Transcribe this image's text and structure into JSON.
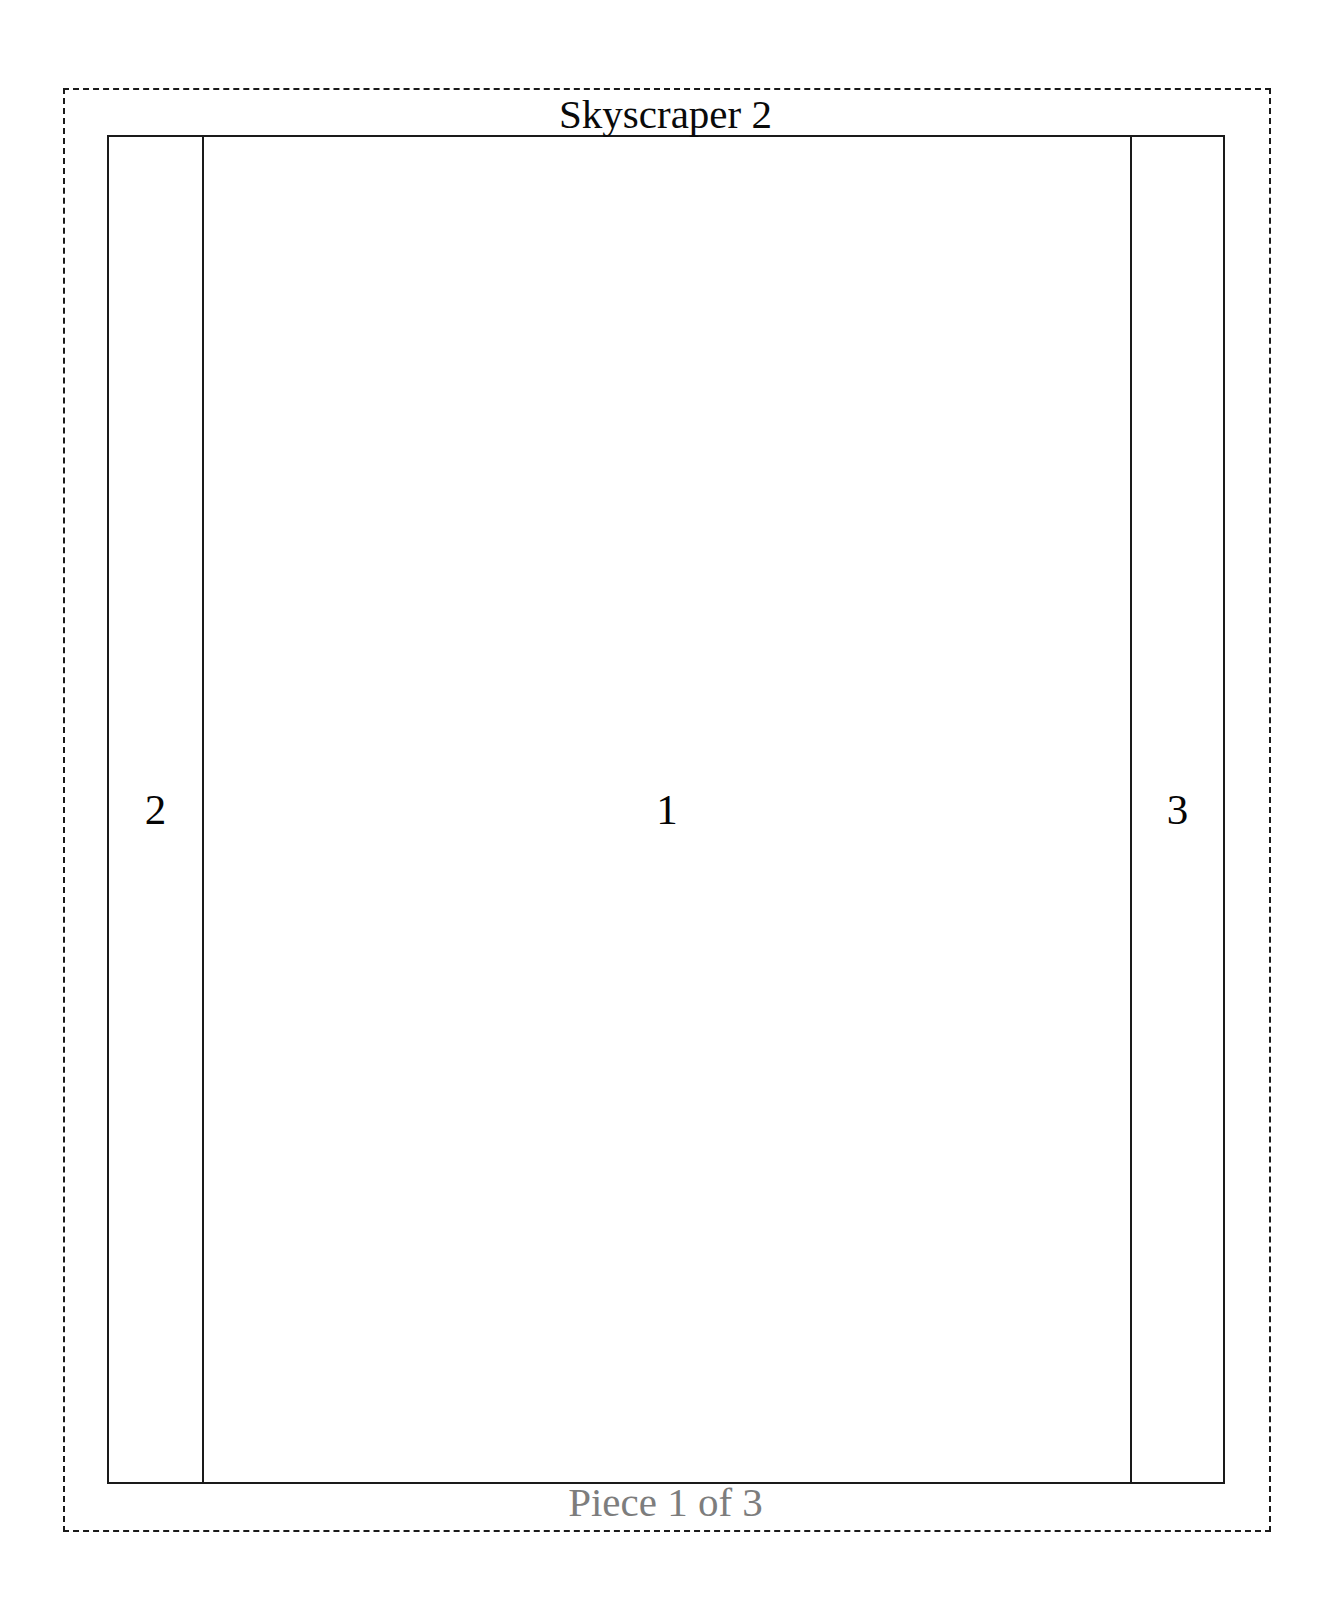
{
  "document": {
    "title": "Skyscraper 2",
    "footer": "Piece 1 of 3",
    "piece_number": 1,
    "piece_total": 3
  },
  "colors": {
    "background": "#ffffff",
    "line": "#1a1a1a",
    "title_text": "#0a0a0a",
    "footer_text": "#7d7d7d",
    "number_text": "#050505"
  },
  "cut_outline": {
    "style": "dashed",
    "label": "cut-line-border"
  },
  "panel": {
    "columns": [
      {
        "id": "left-flap",
        "label": "2",
        "role": "glue-flap-left"
      },
      {
        "id": "main-face",
        "label": "1",
        "role": "main-face"
      },
      {
        "id": "right-flap",
        "label": "3",
        "role": "glue-flap-right"
      }
    ]
  }
}
